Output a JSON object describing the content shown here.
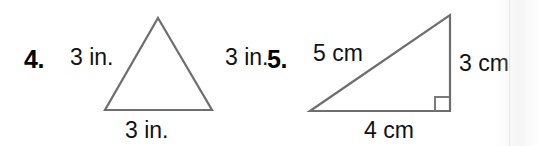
{
  "page": {
    "background_color": "#ffffff",
    "line_color": "#6e6e6e",
    "text_color": "#111111",
    "width": 541,
    "height": 146
  },
  "problems": [
    {
      "number": "4.",
      "shape": "equilateral-triangle",
      "unit": "in.",
      "labels": {
        "left_side": "3 in.",
        "right_side": "3 in.",
        "base": "3 in."
      },
      "side_lengths": [
        3,
        3,
        3
      ],
      "right_angle_marked": false
    },
    {
      "number": "5.",
      "shape": "right-triangle",
      "unit": "cm",
      "labels": {
        "hypotenuse": "5 cm",
        "vertical_leg": "3 cm",
        "base": "4 cm"
      },
      "side_lengths": [
        5,
        3,
        4
      ],
      "right_angle_marked": true
    }
  ]
}
